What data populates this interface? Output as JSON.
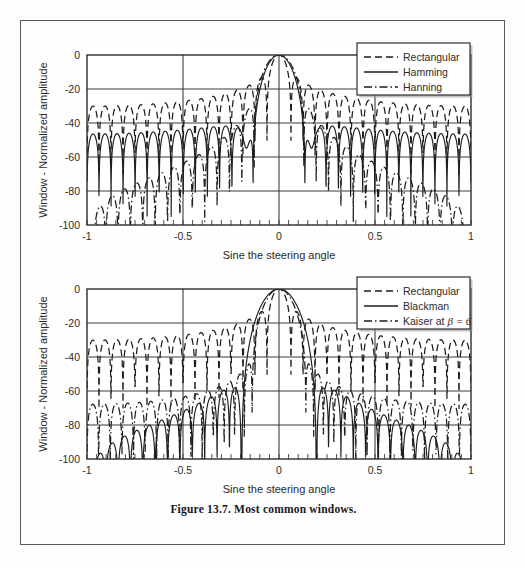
{
  "figure": {
    "caption": "Figure 13.7. Most common windows.",
    "frame_color": "#5a5a5a"
  },
  "axes": {
    "xlabel": "Sine the steering angle",
    "ylabel": "Window - Normalized amplitude",
    "xticks": [
      "-1",
      "-0.5",
      "0",
      "0.5",
      "1"
    ],
    "yticks": [
      "0",
      "-20",
      "-40",
      "-60",
      "-80",
      "-100"
    ]
  },
  "chart_data": [
    {
      "id": "chart-1",
      "type": "line",
      "title": "",
      "xlabel": "Sine the steering angle",
      "ylabel": "Window - Normalized amplitude",
      "xlim": [
        -1,
        1
      ],
      "ylim": [
        -100,
        0
      ],
      "xticks": [
        -1,
        -0.5,
        0,
        0.5,
        1
      ],
      "yticks": [
        0,
        -20,
        -40,
        -60,
        -80,
        -100
      ],
      "grid": true,
      "legend_position": "top-right",
      "series": [
        {
          "name": "Rectangular",
          "style": "dashed",
          "window": "rectangular",
          "N": 32,
          "peak_sidelobe_db": -13.3,
          "mainlobe_half_width": 0.0625,
          "sidelobe_envelope_db": [
            -13.3,
            -17.8,
            -20.8,
            -23.0,
            -24.8,
            -26.2,
            -27.5,
            -28.6,
            -29.5,
            -30.4,
            -31.2,
            -31.9,
            -32.6,
            -33.2,
            -33.7
          ]
        },
        {
          "name": "Hamming",
          "style": "solid",
          "window": "hamming",
          "N": 32,
          "peak_sidelobe_db": -42.7,
          "mainlobe_half_width": 0.125,
          "sidelobe_envelope_db": [
            -42.7,
            -47.0,
            -49.5,
            -51.2,
            -52.4,
            -53.3,
            -54.0,
            -54.6,
            -55.1,
            -55.5,
            -55.8,
            -56.1,
            -56.4
          ]
        },
        {
          "name": "Hanning",
          "style": "dash-dot",
          "window": "hanning",
          "N": 32,
          "peak_sidelobe_db": -31.5,
          "mainlobe_half_width": 0.125,
          "sidelobe_envelope_db": [
            -31.5,
            -41.5,
            -48.0,
            -53.0,
            -57.0,
            -60.5,
            -63.5,
            -66.5,
            -69.0,
            -71.5,
            -74.0,
            -76.0,
            -78.0
          ]
        }
      ]
    },
    {
      "id": "chart-2",
      "type": "line",
      "title": "",
      "xlabel": "Sine the steering angle",
      "ylabel": "Window - Normalized amplitude",
      "xlim": [
        -1,
        1
      ],
      "ylim": [
        -100,
        0
      ],
      "xticks": [
        -1,
        -0.5,
        0,
        0.5,
        1
      ],
      "yticks": [
        0,
        -20,
        -40,
        -60,
        -80,
        -100
      ],
      "grid": true,
      "legend_position": "top-right",
      "series": [
        {
          "name": "Rectangular",
          "style": "dashed",
          "window": "rectangular",
          "N": 32,
          "peak_sidelobe_db": -13.3,
          "mainlobe_half_width": 0.0625,
          "sidelobe_envelope_db": [
            -13.3,
            -17.8,
            -20.8,
            -23.0,
            -24.8,
            -26.2,
            -27.5,
            -28.6,
            -29.5,
            -30.4,
            -31.2,
            -31.9,
            -32.6,
            -33.2,
            -33.7
          ]
        },
        {
          "name": "Blackman",
          "style": "solid",
          "window": "blackman",
          "N": 32,
          "peak_sidelobe_db": -58.1,
          "mainlobe_half_width": 0.1875,
          "sidelobe_envelope_db": [
            -58.1,
            -60.5,
            -62.0,
            -63.0,
            -63.8,
            -64.4,
            -64.9,
            -65.3,
            -65.7,
            -66.0,
            -66.3
          ]
        },
        {
          "name": "Kaiser at β = 6",
          "beta": 6,
          "style": "dash-dot",
          "window": "kaiser",
          "N": 32,
          "peak_sidelobe_db": -65.0,
          "mainlobe_half_width": 0.15,
          "sidelobe_envelope_db": [
            -65.0,
            -72.0,
            -77.0,
            -80.5,
            -83.0,
            -85.0,
            -86.5,
            -88.0,
            -89.0,
            -90.0,
            -91.0
          ]
        }
      ]
    }
  ],
  "legends": [
    {
      "id": "legend-1",
      "entries": [
        {
          "label": "Rectangular",
          "style": "dashed"
        },
        {
          "label": "Hamming",
          "style": "solid"
        },
        {
          "label": "Hanning",
          "style": "dash-dot"
        }
      ]
    },
    {
      "id": "legend-2",
      "entries": [
        {
          "label": "Rectangular",
          "style": "dashed"
        },
        {
          "label": "Blackman",
          "style": "solid"
        },
        {
          "label": "Kaiser at",
          "beta_suffix": "β = 6",
          "style": "dash-dot"
        }
      ]
    }
  ]
}
